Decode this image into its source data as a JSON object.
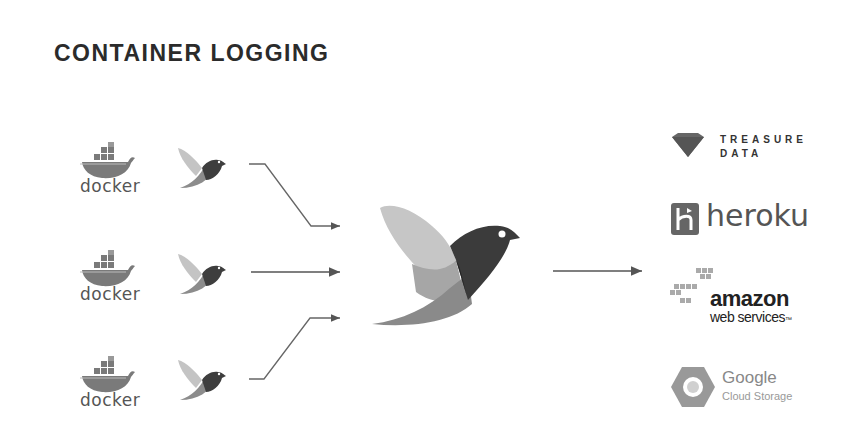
{
  "title": "CONTAINER LOGGING",
  "sources": [
    {
      "label": "docker",
      "icon": "docker-whale-icon",
      "agent_icon": "fluentd-bird-small-icon"
    },
    {
      "label": "docker",
      "icon": "docker-whale-icon",
      "agent_icon": "fluentd-bird-small-icon"
    },
    {
      "label": "docker",
      "icon": "docker-whale-icon",
      "agent_icon": "fluentd-bird-small-icon"
    }
  ],
  "aggregator": {
    "icon": "fluentd-bird-large-icon"
  },
  "destinations": {
    "treasure_data": {
      "line1": "TREASURE",
      "line2": "DATA",
      "icon": "treasure-data-gem-icon"
    },
    "heroku": {
      "label": "heroku",
      "icon": "heroku-logo-icon"
    },
    "aws": {
      "line1": "amazon",
      "line2": "web services",
      "tm": "™",
      "icon": "aws-cubes-icon"
    },
    "gcs": {
      "line1": "Google",
      "line2": "Cloud Storage",
      "icon": "gcs-hexagon-icon"
    }
  },
  "colors": {
    "text": "#2b2b2b",
    "arrow": "#555555",
    "bird_light": "#c9c9c9",
    "bird_mid": "#8e8e8e",
    "bird_dark": "#3c3c3c"
  }
}
